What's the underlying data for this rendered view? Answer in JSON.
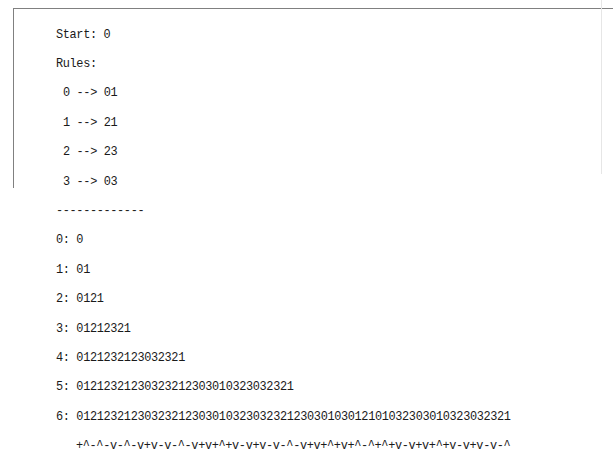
{
  "header": {
    "start_label": "Start: 0",
    "rules_label": "Rules:"
  },
  "rules": [
    {
      "text": "0 --> 01",
      "from": "0",
      "to": "01"
    },
    {
      "text": "1 --> 21",
      "from": "1",
      "to": "21"
    },
    {
      "text": "2 --> 23",
      "from": "2",
      "to": "23"
    },
    {
      "text": "3 --> 03",
      "from": "3",
      "to": "03"
    }
  ],
  "separator": "-------------",
  "generations": [
    {
      "text": "0: 0",
      "index": 0,
      "value": "0"
    },
    {
      "text": "1: 01",
      "index": 1,
      "value": "01"
    },
    {
      "text": "2: 0121",
      "index": 2,
      "value": "0121"
    },
    {
      "text": "3: 01212321",
      "index": 3,
      "value": "01212321"
    },
    {
      "text": "4: 0121232123032321",
      "index": 4,
      "value": "0121232123032321"
    },
    {
      "text": "5: 01212321230323212303010323032321",
      "index": 5,
      "value": "01212321230323212303010323032321"
    },
    {
      "text": "6: 0121232123032321230301032303232123030103012101032303010323032321",
      "index": 6,
      "value": "0121232123032321230301032303232123030103012101032303010323032321"
    }
  ],
  "symbol_line": "+^-^-v-^-v+v-v-^-v+v+^+v-v+v-v-^-v+v+^+v+^-^+^+v-v+v+^+v-v+v-v-^",
  "colors": {
    "text": "#1a1a1a",
    "border": "#808080",
    "background": "#ffffff"
  }
}
